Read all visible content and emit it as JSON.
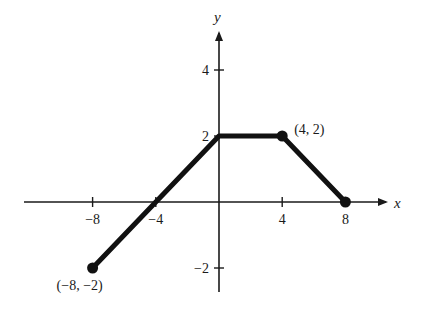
{
  "chart_data": {
    "type": "line",
    "title": "",
    "xlabel": "x",
    "ylabel": "y",
    "xlim": [
      -9.5,
      10
    ],
    "ylim": [
      -2.6,
      5
    ],
    "x_ticks": [
      -8,
      -4,
      4,
      8
    ],
    "y_ticks": [
      4,
      2,
      -2
    ],
    "x_tick_labels": [
      "−8",
      "−4",
      "4",
      "8"
    ],
    "y_tick_labels": [
      "4",
      "2",
      "−2"
    ],
    "grid": false,
    "series": [
      {
        "name": "piecewise linear graph",
        "x": [
          -8,
          0,
          4,
          8
        ],
        "y": [
          -2,
          2,
          2,
          0
        ],
        "color": "#111111"
      }
    ],
    "endpoints": [
      {
        "x": -8,
        "y": -2,
        "label": "(−8, −2)"
      },
      {
        "x": 4,
        "y": 2,
        "label": "(4, 2)"
      },
      {
        "x": 8,
        "y": 0,
        "label": ""
      }
    ]
  }
}
